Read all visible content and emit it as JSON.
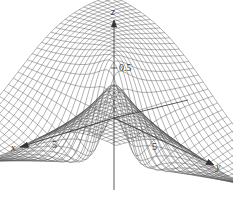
{
  "chart_data": {
    "type": "surface3d",
    "title": "",
    "style": "wireframe mesh",
    "axes": {
      "x": {
        "label": "x",
        "ticks": [
          {
            "value": 5,
            "label": "5"
          }
        ]
      },
      "y": {
        "label": "y",
        "ticks": [
          {
            "value": 5,
            "label": "5"
          }
        ]
      },
      "z": {
        "label": "z",
        "ticks": [
          {
            "value": 0.5,
            "label": "0.5"
          }
        ]
      }
    },
    "colors": {
      "mesh": "#555555",
      "axis": "#333333",
      "background": "#ffffff"
    }
  },
  "labels": {
    "x_axis": "x",
    "y_axis": "y",
    "z_axis": "z",
    "x_tick": "5",
    "y_tick": "5",
    "z_tick": "0.5"
  }
}
